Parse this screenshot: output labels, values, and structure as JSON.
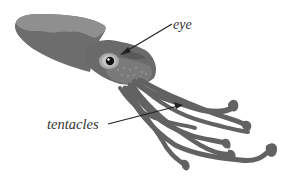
{
  "diagram": {
    "labels": {
      "eye": "eye",
      "tentacles": "tentacles"
    },
    "colors": {
      "body_dark": "#6b6b6b",
      "body_light": "#8c8c8c",
      "head": "#5f5f5f",
      "tentacle": "#626262",
      "eye_ring": "#a8a8a8",
      "pupil": "#111111",
      "arrow": "#222222",
      "background": "#ffffff"
    }
  }
}
